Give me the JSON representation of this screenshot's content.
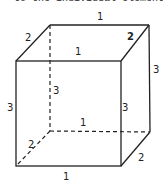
{
  "caption": "to the individual elements",
  "figure": {
    "type": "rectangular box (cuboid) with edge lengths",
    "labels": {
      "top_back": "1",
      "top_left_depth": "2",
      "top_right_depth": "2",
      "top_front": "1",
      "right_back_height": "3",
      "hidden_back_height": "3",
      "front_left_height": "3",
      "front_right_height": "3",
      "hidden_back_bottom": "1",
      "hidden_bottom_left_depth": "2",
      "bottom_right_depth": "2",
      "bottom_front": "1"
    },
    "colors": {
      "line": "#222222",
      "background": "#ffffff"
    }
  }
}
